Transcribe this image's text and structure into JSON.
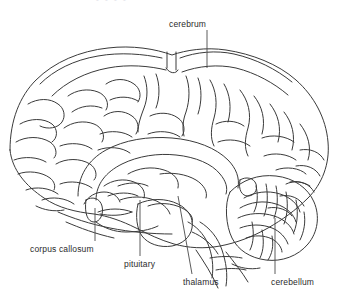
{
  "figure": {
    "kind": "anatomical-line-drawing",
    "background_color": "#ffffff",
    "line_color": "#3a3a3a",
    "text_color": "#2b2b2b",
    "cropped_header_text": "•  •  •  •"
  },
  "labels": {
    "cerebrum": "cerebrum",
    "corpus_callosum": "corpus callosum",
    "pituitary": "pituitary",
    "thalamus": "thalamus",
    "cerebellum": "cerebellum"
  }
}
